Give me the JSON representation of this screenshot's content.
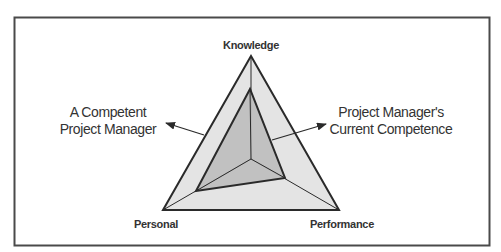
{
  "diagram": {
    "type": "triangular-radar",
    "axes": [
      {
        "label": "Knowledge",
        "position": "top"
      },
      {
        "label": "Personal",
        "position": "bottom-left"
      },
      {
        "label": "Performance",
        "position": "bottom-right"
      }
    ],
    "callouts": {
      "left": {
        "line1": "A Competent",
        "line2": "Project Manager",
        "points_to": "outer-triangle"
      },
      "right": {
        "line1": "Project Manager's",
        "line2": "Current Competence",
        "points_to": "inner-triangle"
      }
    },
    "colors": {
      "outer_fill": "#e4e4e4",
      "inner_fill": "#bcbcbc",
      "stroke": "#2a2a2a",
      "frame": "#4a4a4a",
      "text": "#333333"
    }
  }
}
